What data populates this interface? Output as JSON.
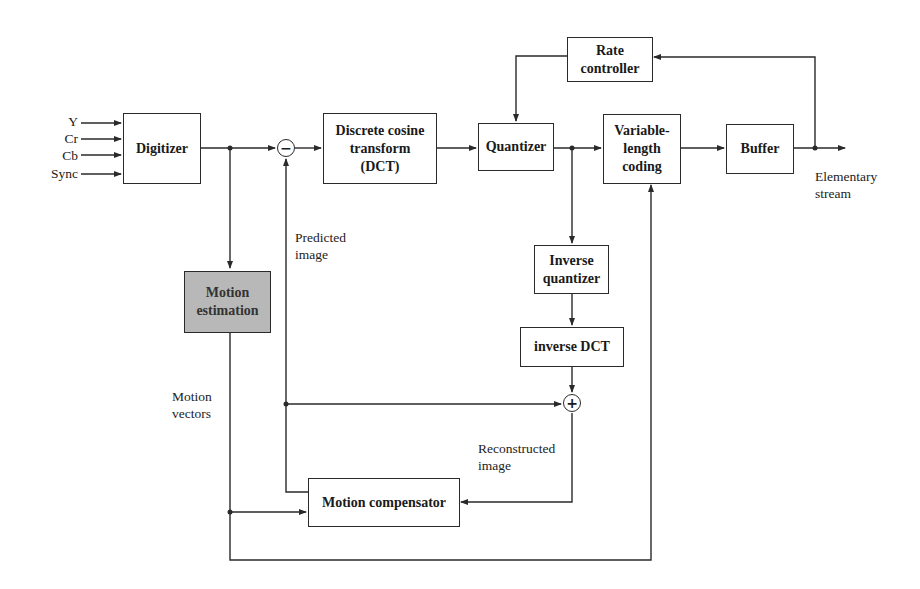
{
  "diagram": {
    "inputs": [
      "Y",
      "Cr",
      "Cb",
      "Sync"
    ],
    "blocks": {
      "digitizer": "Digitizer",
      "dct": [
        "Discrete cosine",
        "transform",
        "(DCT)"
      ],
      "quantizer": "Quantizer",
      "rate_controller": [
        "Rate",
        "controller"
      ],
      "vlc": [
        "Variable-",
        "length",
        "coding"
      ],
      "buffer": "Buffer",
      "inverse_quantizer": [
        "Inverse",
        "quantizer"
      ],
      "inverse_dct": "inverse DCT",
      "motion_estimation": [
        "Motion",
        "estimation"
      ],
      "motion_compensator": "Motion compensator"
    },
    "operators": {
      "subtract": "−",
      "add": "+"
    },
    "annotations": {
      "predicted_image": [
        "Predicted",
        "image"
      ],
      "motion_vectors": [
        "Motion",
        "vectors"
      ],
      "reconstructed_image": [
        "Reconstructed",
        "image"
      ],
      "output": [
        "Elementary",
        "stream"
      ]
    },
    "colors": {
      "line": "#2a2a2a",
      "shaded_block": "#b8b8b8"
    }
  }
}
